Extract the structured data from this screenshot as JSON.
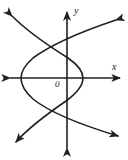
{
  "figure": {
    "background_color": "#ffffff",
    "stroke_color": "#231f20",
    "axis_stroke_width": 1.6,
    "curve_stroke_width": 1.6
  },
  "axes": {
    "x_label": "x",
    "y_label": "y",
    "origin_label": "0",
    "x_axis": {
      "y_px": 78,
      "x_start_px": 8,
      "x_end_px": 122,
      "arrows": [
        "left",
        "right"
      ]
    },
    "y_axis": {
      "x_px": 67,
      "y_start_px": 10,
      "y_end_px": 150,
      "arrows": [
        "up",
        "down"
      ]
    }
  },
  "chart_data": {
    "type": "line",
    "xlabel": "x",
    "ylabel": "y",
    "grid": false,
    "legend": "none",
    "origin_px": {
      "x": 67,
      "y": 78
    },
    "series": [
      {
        "name": "curve-opening-right",
        "description": "Parabola-like branch opening toward the upper right and lower right, vertex on the left",
        "vertex_px": {
          "x": 21,
          "y": 78
        },
        "arrow_ends_px": [
          {
            "x": 116,
            "y": 20
          },
          {
            "x": 118,
            "y": 136
          }
        ],
        "path": "M 116 20 C 86 30, 52 44, 33 58 C 24 66, 21 72, 21 78 C 21 84, 24 91, 33 99 C 53 115, 88 127, 118 136"
      },
      {
        "name": "curve-opening-left",
        "description": "Hyperbola-like branch opening toward the upper left and lower left, vertex on the right",
        "vertex_px": {
          "x": 83,
          "y": 78
        },
        "arrow_ends_px": [
          {
            "x": 12,
            "y": 16
          },
          {
            "x": 16,
            "y": 142
          }
        ],
        "path": "M 12 16 C 30 34, 52 48, 68 58 C 78 65, 83 72, 83 78 C 83 85, 77 93, 66 101 C 50 112, 30 126, 16 142"
      }
    ],
    "x_axis_crossings_px": [
      21,
      44,
      83
    ],
    "intersection_count": 4
  }
}
